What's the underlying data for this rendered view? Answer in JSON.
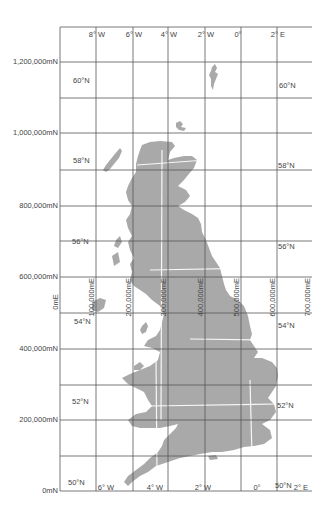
{
  "map": {
    "title": "British National Grid with latitude/longitude graticule",
    "land_color": "#a9a9a9",
    "grid_color": "#555555",
    "background": "#ffffff",
    "northings": [
      {
        "label": "0mN",
        "y": 491
      },
      {
        "label": "200,000mN",
        "y": 420
      },
      {
        "label": "400,000mN",
        "y": 349
      },
      {
        "label": "600,000mN",
        "y": 277
      },
      {
        "label": "800,000mN",
        "y": 206
      },
      {
        "label": "1,000,000mN",
        "y": 133
      },
      {
        "label": "1,200,000mN",
        "y": 62
      }
    ],
    "eastings": [
      {
        "label": "0mE",
        "x": 60
      },
      {
        "label": "100,000mE",
        "x": 96
      },
      {
        "label": "200,000mE",
        "x": 133
      },
      {
        "label": "300,000mE",
        "x": 168
      },
      {
        "label": "400,000mE",
        "x": 205
      },
      {
        "label": "500,000mE",
        "x": 241
      },
      {
        "label": "600,000mE",
        "x": 277
      },
      {
        "label": "700,000mE",
        "x": 312
      }
    ],
    "top_longitudes": [
      "8° W",
      "6° W",
      "4° W",
      "2° W",
      "0°",
      "2° E"
    ],
    "bottom_longitudes": [
      "6° W",
      "4° W",
      "2° W",
      "0°",
      "2° E"
    ],
    "left_latitudes": [
      "60°N",
      "58°N",
      "56°N",
      "54°N",
      "52°N",
      "50°N"
    ],
    "right_latitudes": [
      "60°N",
      "58°N",
      "56°N",
      "54°N",
      "52°N",
      "50°N"
    ]
  }
}
